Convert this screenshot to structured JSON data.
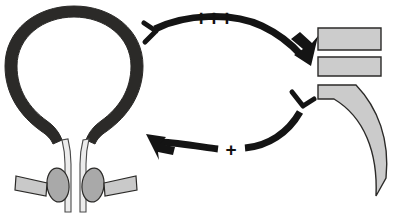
{
  "figure": {
    "background_color": "#ffffff"
  },
  "colors": {
    "bladder_wall": "#2b2a28",
    "arrow": "#141414",
    "muscle_fill": "#c9c9c9",
    "muscle_fill_light": "#d2d2d2",
    "muscle_outline": "#2b2a28",
    "urethra_fill": "#e8e8e8",
    "sphincter_fill": "#a8a8a8",
    "text": "#111111"
  },
  "labels": {
    "excitation_strong": "+++",
    "excitation_weak": "+"
  },
  "anatomy": {
    "bladder": {
      "name": "bladder-wall",
      "shape": "thick dark ring / detrusor outline"
    },
    "urethra": {
      "name": "urethra-tube",
      "shape": "two parallel vertical light tubes"
    },
    "sphincter_left": {
      "name": "sphincter-oval-left",
      "shape": "oval"
    },
    "sphincter_right": {
      "name": "sphincter-oval-right",
      "shape": "oval"
    },
    "pelvic_floor_left": {
      "name": "pelvic-floor-bar-left",
      "shape": "slanted bar"
    },
    "pelvic_floor_right": {
      "name": "pelvic-floor-bar-right",
      "shape": "slanted bar"
    }
  },
  "right_column": {
    "bar_top": {
      "name": "muscle-bar-top",
      "shape": "rectangle"
    },
    "bar_middle": {
      "name": "muscle-bar-middle",
      "shape": "rectangle"
    },
    "crescent": {
      "name": "crescent-muscle",
      "shape": "curved crescent / claw"
    }
  },
  "arrows": {
    "upper": {
      "name": "arrow-bladder-to-muscle",
      "label": "+++",
      "direction": "left-to-right, curving down",
      "start_tip": "barbed-fork",
      "end_tip": "solid-triangle"
    },
    "lower": {
      "name": "arrow-muscle-to-bladder",
      "label": "+",
      "direction": "right-to-left, curving up",
      "start_tip": "barbed-fork",
      "end_tip": "solid-triangle"
    }
  }
}
